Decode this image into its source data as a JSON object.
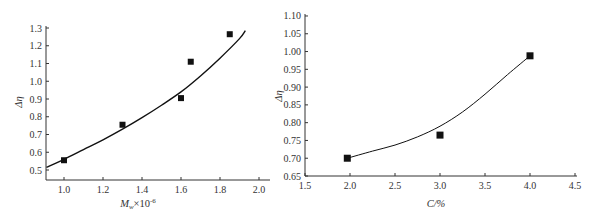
{
  "chart_data": [
    {
      "type": "scatter",
      "title": "",
      "xlabel": "Mw×10^-6",
      "xlabel_main": "M",
      "xlabel_sub": "w",
      "xlabel_rest": "×10",
      "xlabel_sup": "-6",
      "ylabel": "Δη",
      "xlim": [
        0.91,
        2.0
      ],
      "ylim": [
        0.46,
        1.3
      ],
      "xticks": [
        "1.0",
        "1.2",
        "1.4",
        "1.6",
        "1.8",
        "2.0"
      ],
      "yticks": [
        "0.5",
        "0.6",
        "0.7",
        "0.8",
        "0.9",
        "1.0",
        "1.1",
        "1.2",
        "1.3"
      ],
      "grid": false,
      "legend": null,
      "series": [
        {
          "name": "data",
          "marker": "square",
          "x": [
            1.0,
            1.3,
            1.6,
            1.65,
            1.85
          ],
          "y": [
            0.555,
            0.755,
            0.905,
            1.11,
            1.265
          ]
        },
        {
          "name": "fit",
          "style": "line",
          "x": [
            0.91,
            1.0,
            1.1,
            1.2,
            1.3,
            1.4,
            1.5,
            1.6,
            1.7,
            1.8,
            1.9,
            1.93
          ],
          "y": [
            0.515,
            0.56,
            0.615,
            0.67,
            0.73,
            0.795,
            0.865,
            0.94,
            1.03,
            1.13,
            1.24,
            1.285
          ]
        }
      ]
    },
    {
      "type": "scatter",
      "title": "",
      "xlabel": "C/%",
      "ylabel": "Δη",
      "xlim": [
        1.5,
        4.5
      ],
      "ylim": [
        0.65,
        1.1
      ],
      "xticks": [
        "1.5",
        "2.0",
        "2.5",
        "3.0",
        "3.5",
        "4.0",
        "4.5"
      ],
      "yticks": [
        "0.65",
        "0.70",
        "0.75",
        "0.80",
        "0.85",
        "0.90",
        "0.95",
        "1.00",
        "1.05",
        "1.10"
      ],
      "grid": false,
      "legend": null,
      "series": [
        {
          "name": "data",
          "marker": "square",
          "x": [
            1.97,
            3.0,
            4.0
          ],
          "y": [
            0.7,
            0.765,
            0.988
          ]
        },
        {
          "name": "fit",
          "style": "line",
          "x": [
            1.97,
            2.25,
            2.5,
            2.75,
            3.0,
            3.25,
            3.5,
            3.75,
            4.0
          ],
          "y": [
            0.7,
            0.72,
            0.737,
            0.76,
            0.79,
            0.83,
            0.88,
            0.935,
            0.988
          ]
        }
      ]
    }
  ]
}
